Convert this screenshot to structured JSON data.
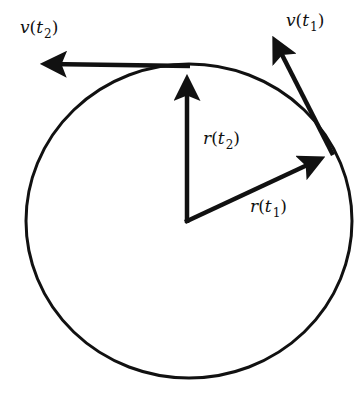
{
  "diagram": {
    "type": "uniform-circular-motion-vectors",
    "colors": {
      "ink": "#111111",
      "background": "#ffffff"
    },
    "circle": {
      "cx": 189,
      "cy": 221,
      "rx": 163,
      "ry": 157
    },
    "center": {
      "x": 187,
      "y": 221
    },
    "vectors": {
      "r_t1": {
        "from": [
          187,
          221
        ],
        "to": [
          332,
          153
        ],
        "label": {
          "sym": "r",
          "open": "(",
          "var": "t",
          "sub": "1",
          "close": ")"
        }
      },
      "r_t2": {
        "from": [
          187,
          221
        ],
        "to": [
          187,
          66
        ],
        "label": {
          "sym": "r",
          "open": "(",
          "var": "t",
          "sub": "2",
          "close": ")"
        }
      },
      "v_t1": {
        "from": [
          332,
          153
        ],
        "to": [
          268,
          28
        ],
        "label": {
          "sym": "v",
          "open": "(",
          "var": "t",
          "sub": "1",
          "close": ")"
        }
      },
      "v_t2": {
        "from": [
          187,
          66
        ],
        "to": [
          32,
          64
        ],
        "label": {
          "sym": "v",
          "open": "(",
          "var": "t",
          "sub": "2",
          "close": ")"
        }
      }
    }
  }
}
